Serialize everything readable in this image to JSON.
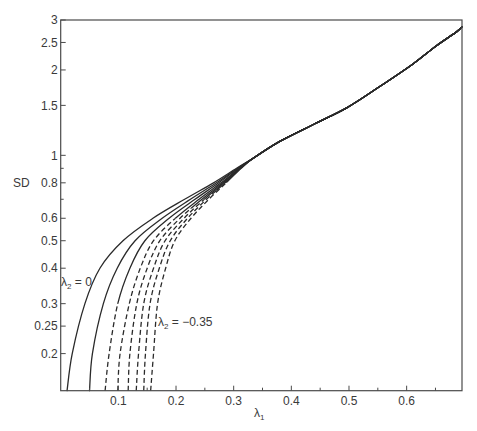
{
  "figure": {
    "y_axis_label": "SD",
    "x_axis_label": {
      "base": "λ",
      "sub": "1"
    },
    "annotations": [
      {
        "base": "λ",
        "sub": "2",
        "rest": " = 0",
        "at": [
          0.0005,
          0.36
        ]
      },
      {
        "base": "λ",
        "sub": "2",
        "rest": " = −0.35",
        "at": [
          0.169,
          0.226
        ]
      }
    ]
  },
  "chart_data": {
    "type": "line",
    "title": "",
    "xlabel": "λ1",
    "ylabel": "SD",
    "xlim": [
      0,
      0.696
    ],
    "ylim": [
      0.148,
      3.0
    ],
    "yscale": "log",
    "grid": false,
    "legend": null,
    "x_ticks": [
      0.1,
      0.2,
      0.3,
      0.4,
      0.5,
      0.6
    ],
    "x_tick_labels": [
      "0.1",
      "0.2",
      "0.3",
      "0.4",
      "0.5",
      "0.6"
    ],
    "x_minor_ticks": [
      0.05,
      0.15,
      0.25,
      0.35,
      0.45,
      0.55,
      0.65
    ],
    "y_ticks": [
      3,
      2.5,
      2,
      1.5,
      1,
      0.8,
      0.6,
      0.5,
      0.4,
      0.3,
      0.25,
      0.2
    ],
    "y_tick_labels": [
      "3",
      "2.5",
      "2",
      "1.5",
      "1",
      "0.8",
      "0.6",
      "0.5",
      "0.4",
      "0.3",
      "0.25",
      "0.2"
    ],
    "y_minor_ticks": [
      0.9,
      0.7
    ],
    "sd_levels": [
      0.148,
      0.2,
      0.3,
      0.4,
      0.5,
      0.6,
      0.7,
      0.8,
      0.9
    ],
    "series": [
      {
        "name": "λ2 = 0",
        "lambda2": 0,
        "dashed_below_sd": null,
        "x": [
          0.011,
          0.02,
          0.042,
          0.068,
          0.108,
          0.16,
          0.215,
          0.265,
          0.305
        ]
      },
      {
        "name": "λ2 = -0.05",
        "lambda2": -0.05,
        "dashed_below_sd": null,
        "x": [
          0.05,
          0.055,
          0.074,
          0.098,
          0.129,
          0.176,
          0.225,
          0.27,
          0.307
        ]
      },
      {
        "name": "λ2 = -0.10",
        "lambda2": -0.1,
        "dashed_below_sd": 0.3,
        "x": [
          0.077,
          0.084,
          0.099,
          0.12,
          0.146,
          0.188,
          0.233,
          0.274,
          0.308
        ]
      },
      {
        "name": "λ2 = -0.15",
        "lambda2": -0.15,
        "dashed_below_sd": 0.6,
        "x": [
          0.099,
          0.103,
          0.119,
          0.138,
          0.161,
          0.199,
          0.24,
          0.278,
          0.31
        ]
      },
      {
        "name": "λ2 = -0.20",
        "lambda2": -0.2,
        "dashed_below_sd": 0.65,
        "x": [
          0.117,
          0.12,
          0.132,
          0.15,
          0.172,
          0.207,
          0.245,
          0.281,
          0.311
        ]
      },
      {
        "name": "λ2 = -0.25",
        "lambda2": -0.25,
        "dashed_below_sd": 0.7,
        "x": [
          0.131,
          0.135,
          0.144,
          0.161,
          0.181,
          0.214,
          0.249,
          0.283,
          0.311
        ]
      },
      {
        "name": "λ2 = -0.30",
        "lambda2": -0.3,
        "dashed_below_sd": 0.75,
        "x": [
          0.144,
          0.147,
          0.155,
          0.171,
          0.19,
          0.22,
          0.253,
          0.285,
          0.312
        ]
      },
      {
        "name": "λ2 = -0.35",
        "lambda2": -0.35,
        "dashed_below_sd": 0.8,
        "x": [
          0.156,
          0.161,
          0.168,
          0.182,
          0.198,
          0.226,
          0.257,
          0.287,
          0.313
        ]
      }
    ],
    "shared_branch": {
      "x": [
        0.335,
        0.38,
        0.44,
        0.496,
        0.55,
        0.611,
        0.65,
        0.687,
        0.696
      ],
      "y": [
        0.98,
        1.12,
        1.29,
        1.47,
        1.73,
        2.1,
        2.42,
        2.73,
        2.84
      ]
    },
    "colors": {
      "line": "#2a2a2a",
      "axis": "#4a4a4a",
      "text": "#3a3a3a",
      "background": "#ffffff"
    }
  }
}
